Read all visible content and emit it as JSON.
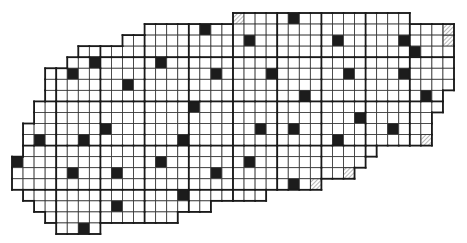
{
  "figure": {
    "type": "cell-grid-map",
    "cell_size": 11.05,
    "origin": [
      12,
      13
    ],
    "columns": 40,
    "rows": 20,
    "colors": {
      "background": "#ffffff",
      "cell_fill": "#ffffff",
      "grid_line": "#333333",
      "thick_line": "#1a1a1a",
      "filled_cell": "#1c1c1c",
      "hatch": "#888888"
    },
    "row_spans": [
      {
        "row": 0,
        "from": 20,
        "to": 35
      },
      {
        "row": 1,
        "from": 12,
        "to": 39
      },
      {
        "row": 2,
        "from": 10,
        "to": 39
      },
      {
        "row": 3,
        "from": 6,
        "to": 39
      },
      {
        "row": 4,
        "from": 5,
        "to": 39
      },
      {
        "row": 5,
        "from": 3,
        "to": 39
      },
      {
        "row": 6,
        "from": 3,
        "to": 39
      },
      {
        "row": 7,
        "from": 3,
        "to": 38
      },
      {
        "row": 8,
        "from": 2,
        "to": 38
      },
      {
        "row": 9,
        "from": 2,
        "to": 37
      },
      {
        "row": 10,
        "from": 1,
        "to": 37
      },
      {
        "row": 11,
        "from": 1,
        "to": 37
      },
      {
        "row": 12,
        "from": 1,
        "to": 32
      },
      {
        "row": 13,
        "from": 0,
        "to": 31
      },
      {
        "row": 14,
        "from": 0,
        "to": 30
      },
      {
        "row": 15,
        "from": 0,
        "to": 27
      },
      {
        "row": 16,
        "from": 1,
        "to": 22
      },
      {
        "row": 17,
        "from": 2,
        "to": 17
      },
      {
        "row": 18,
        "from": 3,
        "to": 14
      },
      {
        "row": 19,
        "from": 4,
        "to": 7
      }
    ],
    "filled_cells": [
      [
        17,
        1
      ],
      [
        25,
        0
      ],
      [
        21,
        2
      ],
      [
        29,
        2
      ],
      [
        35,
        2
      ],
      [
        36,
        3
      ],
      [
        7,
        4
      ],
      [
        13,
        4
      ],
      [
        5,
        5
      ],
      [
        18,
        5
      ],
      [
        23,
        5
      ],
      [
        30,
        5
      ],
      [
        35,
        5
      ],
      [
        10,
        6
      ],
      [
        26,
        7
      ],
      [
        37,
        7
      ],
      [
        16,
        8
      ],
      [
        31,
        9
      ],
      [
        8,
        10
      ],
      [
        22,
        10
      ],
      [
        25,
        10
      ],
      [
        34,
        10
      ],
      [
        2,
        11
      ],
      [
        6,
        11
      ],
      [
        15,
        11
      ],
      [
        29,
        11
      ],
      [
        0,
        13
      ],
      [
        13,
        13
      ],
      [
        21,
        13
      ],
      [
        5,
        14
      ],
      [
        9,
        14
      ],
      [
        18,
        14
      ],
      [
        25,
        15
      ],
      [
        15,
        16
      ],
      [
        9,
        17
      ],
      [
        6,
        19
      ]
    ],
    "hatched_cells": [
      [
        20,
        0
      ],
      [
        39,
        1
      ],
      [
        39,
        2
      ],
      [
        37,
        11
      ],
      [
        30,
        14
      ],
      [
        27,
        15
      ]
    ],
    "thick_vertical_cols": [
      4,
      8,
      12,
      16,
      20,
      24,
      28,
      32,
      36
    ],
    "thick_horizontal_rows": [
      4,
      8,
      12,
      16
    ]
  }
}
